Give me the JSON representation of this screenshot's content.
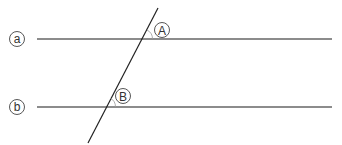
{
  "diagram": {
    "type": "parallel-lines-with-transversal",
    "colors": {
      "line": "#555555",
      "transversal": "#222222",
      "label": "#333333",
      "arc": "#888888"
    },
    "lines": [
      {
        "id": "a",
        "label": "a",
        "x1": 37,
        "y1": 39,
        "x2": 332,
        "y2": 39
      },
      {
        "id": "b",
        "label": "b",
        "x1": 37,
        "y1": 107,
        "x2": 332,
        "y2": 107
      }
    ],
    "transversal": {
      "x1": 158,
      "y1": 8,
      "x2": 88,
      "y2": 143
    },
    "angles": [
      {
        "id": "A",
        "label": "A",
        "at_line": "a"
      },
      {
        "id": "B",
        "label": "B",
        "at_line": "b"
      }
    ]
  }
}
